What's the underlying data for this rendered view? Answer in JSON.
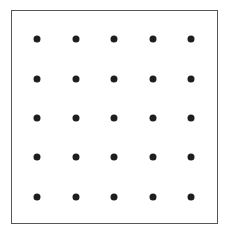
{
  "diagram": {
    "type": "dot-grid",
    "rows": 5,
    "columns": 5,
    "dot_color": "#1e1e1e",
    "border_color": "#555555",
    "background": "#ffffff",
    "column_x": [
      37,
      76,
      114,
      153,
      191
    ],
    "row_y": [
      39,
      79,
      118,
      157,
      197
    ]
  }
}
